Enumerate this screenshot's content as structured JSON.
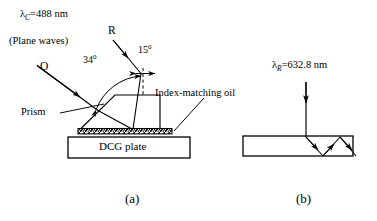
{
  "figure": {
    "type": "optics-schematic",
    "panels": [
      {
        "id": "a",
        "label": "(a)",
        "description": "Recording geometry: two plane waves O and R interfere inside a prism index-matched to a DCG plate"
      },
      {
        "id": "b",
        "label": "(b)",
        "description": "Readout geometry: a normally incident beam is diffracted and guided inside the DCG plate"
      }
    ]
  },
  "panel_a": {
    "wavelength_label": "=488 nm",
    "wavelength_symbol": "λ",
    "wavelength_subscript": "C",
    "plane_waves_label": "(Plane waves)",
    "beam_r_label": "R",
    "beam_o_label": "O",
    "angle_outer": "34",
    "angle_outer_unit": "0",
    "angle_inner": "15",
    "angle_inner_unit": "0",
    "prism_label": "Prism",
    "oil_label": "Index-matching oil",
    "plate_label": "DCG plate",
    "panel_label": "(a)"
  },
  "panel_b": {
    "wavelength_label": "=632.8 nm",
    "wavelength_symbol": "λ",
    "wavelength_subscript": "R",
    "panel_label": "(b)"
  },
  "colors": {
    "ink": "#000000",
    "background": "#ffffff"
  }
}
